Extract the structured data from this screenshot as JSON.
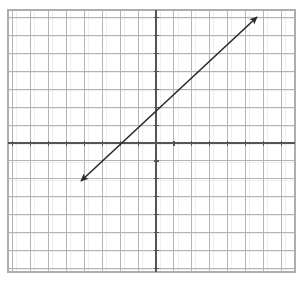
{
  "figure": {
    "background_color": "#ffffff"
  },
  "chart_data": {
    "type": "line",
    "title": "",
    "xlabel": "",
    "ylabel": "",
    "grid": true,
    "grid_color": "#adadad",
    "grid_minor_color": "#d8d8d8",
    "axis_color": "#555555",
    "axis_line_width": 1.3,
    "grid_line_width": 0.9,
    "cell_size_px": 17.9,
    "axes_shown": [
      "x-axis",
      "y-axis"
    ],
    "tick_marks": true,
    "tick_length_px": 5,
    "axis_labels_shown": false,
    "tick_labels_shown": false,
    "xlim": [
      -8.25,
      7.75
    ],
    "ylim": [
      -7.2,
      7.4
    ],
    "origin_px": {
      "x": 156,
      "y": 143
    },
    "plot_area_px": {
      "left": 8,
      "top": 10,
      "right": 295,
      "bottom": 272
    },
    "series": [
      {
        "name": "line",
        "color": "#2a2a2a",
        "line_width": 1.6,
        "equation": "y = x + 2",
        "slope": 1,
        "y_intercept": 2,
        "x_intercept": -2,
        "arrowheads": "both",
        "endpoints_data": [
          {
            "x": -4.2,
            "y": -2.2
          },
          {
            "x": 5.6,
            "y": 7.0
          }
        ],
        "endpoints_px": [
          {
            "x": 81,
            "y": 181
          },
          {
            "x": 257,
            "y": 17
          }
        ],
        "points_through": [
          {
            "x": -2,
            "y": 0
          },
          {
            "x": 0,
            "y": 2
          },
          {
            "x": 2,
            "y": 4
          }
        ]
      }
    ],
    "x_gridlines": [
      -8,
      -7,
      -6,
      -5,
      -4,
      -3,
      -2,
      -1,
      0,
      1,
      2,
      3,
      4,
      5,
      6,
      7
    ],
    "y_gridlines": [
      -7,
      -6,
      -5,
      -4,
      -3,
      -2,
      -1,
      0,
      1,
      2,
      3,
      4,
      5,
      6,
      7
    ]
  }
}
